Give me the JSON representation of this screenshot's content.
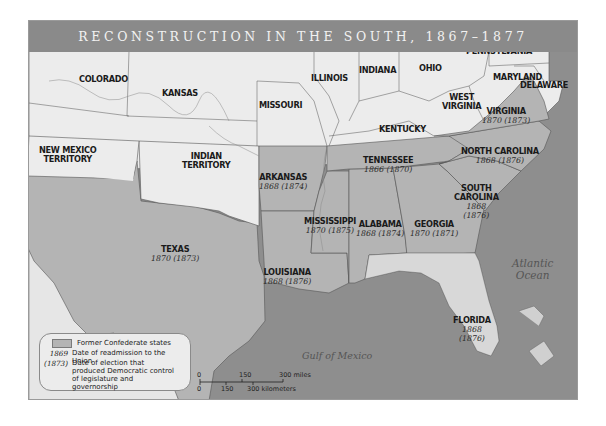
{
  "title": "RECONSTRUCTION IN THE SOUTH, 1867–1877",
  "colors": {
    "union_states": "#ececec",
    "confederate_states": "#b4b4b4",
    "water": "#8e8e8e",
    "title_bar": "#8a8a8a",
    "borders": "#555555"
  },
  "non_confederate_regions": [
    {
      "name": "COLORADO"
    },
    {
      "name": "KANSAS"
    },
    {
      "name": "NEW MEXICO TERRITORY"
    },
    {
      "name": "INDIAN TERRITORY"
    },
    {
      "name": "MISSOURI"
    },
    {
      "name": "ILLINOIS"
    },
    {
      "name": "INDIANA"
    },
    {
      "name": "OHIO"
    },
    {
      "name": "PENNSYLVANIA"
    },
    {
      "name": "MARYLAND"
    },
    {
      "name": "DELAWARE"
    },
    {
      "name": "WEST VIRGINIA"
    },
    {
      "name": "KENTUCKY"
    }
  ],
  "labels": {
    "colorado": "COLORADO",
    "kansas": "KANSAS",
    "new_mexico_1": "NEW MEXICO",
    "new_mexico_2": "TERRITORY",
    "indian_1": "INDIAN",
    "indian_2": "TERRITORY",
    "missouri": "MISSOURI",
    "illinois": "ILLINOIS",
    "indiana": "INDIANA",
    "ohio": "OHIO",
    "pennsylvania": "PENNSYLVANIA",
    "maryland": "MARYLAND",
    "delaware": "DELAWARE",
    "west_virginia_1": "WEST",
    "west_virginia_2": "VIRGINIA",
    "kentucky": "KENTUCKY"
  },
  "confederate_states": [
    {
      "name": "VIRGINIA",
      "readmission": "1870",
      "democratic_control": "(1873)"
    },
    {
      "name": "NORTH CAROLINA",
      "readmission": "1868",
      "democratic_control": "(1876)"
    },
    {
      "name": "TENNESSEE",
      "readmission": "1866",
      "democratic_control": "(1870)"
    },
    {
      "name": "ARKANSAS",
      "readmission": "1868",
      "democratic_control": "(1874)"
    },
    {
      "name": "SOUTH CAROLINA",
      "readmission": "1868",
      "democratic_control": "(1876)"
    },
    {
      "name": "MISSISSIPPI",
      "readmission": "1870",
      "democratic_control": "(1875)"
    },
    {
      "name": "ALABAMA",
      "readmission": "1868",
      "democratic_control": "(1874)"
    },
    {
      "name": "GEORGIA",
      "readmission": "1870",
      "democratic_control": "(1871)"
    },
    {
      "name": "TEXAS",
      "readmission": "1870",
      "democratic_control": "(1873)"
    },
    {
      "name": "LOUISIANA",
      "readmission": "1868",
      "democratic_control": "(1876)"
    },
    {
      "name": "FLORIDA",
      "readmission": "1868",
      "democratic_control": "(1876)"
    }
  ],
  "sc_label": {
    "line1": "SOUTH",
    "line2": "CAROLINA"
  },
  "water_bodies": {
    "atlantic_1": "Atlantic",
    "atlantic_2": "Ocean",
    "gulf": "Gulf of Mexico"
  },
  "legend": {
    "items": [
      {
        "key": "",
        "text": "Former Confederate states"
      },
      {
        "key": "1869",
        "text": "Date of readmission to the Union"
      },
      {
        "key": "(1873)",
        "text": "Date of election that produced Democratic control of legislature and governorship"
      }
    ]
  },
  "scale_bar": {
    "miles": [
      "0",
      "150",
      "300 miles"
    ],
    "kilometers": [
      "0",
      "150",
      "300 kilometers"
    ]
  }
}
